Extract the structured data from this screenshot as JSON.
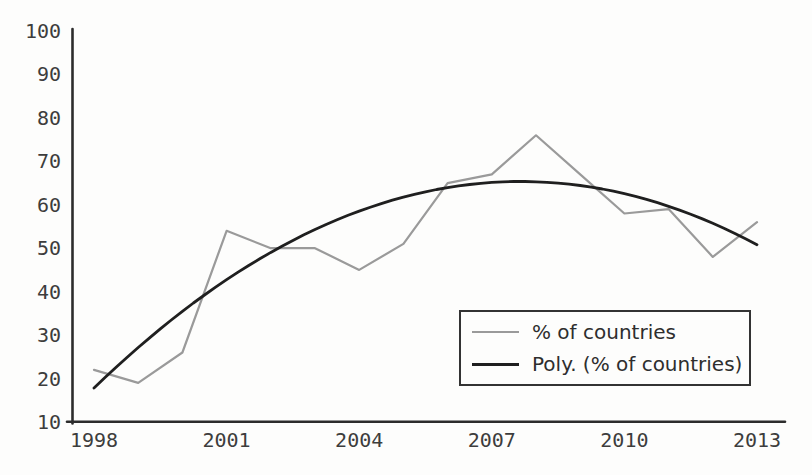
{
  "chart_data": {
    "type": "line",
    "x": [
      1998,
      1999,
      2000,
      2001,
      2002,
      2003,
      2004,
      2005,
      2006,
      2007,
      2008,
      2009,
      2010,
      2011,
      2012,
      2013
    ],
    "x_tick_labels": [
      "1998",
      "2001",
      "2004",
      "2007",
      "2010",
      "2013"
    ],
    "y_ticks": [
      10,
      20,
      30,
      40,
      50,
      60,
      70,
      80,
      90,
      100
    ],
    "xlim": [
      1998,
      2013
    ],
    "ylim": [
      10,
      100
    ],
    "grid": false,
    "legend_position": "lower-right",
    "xlabel": "",
    "ylabel": "",
    "series": [
      {
        "name": "% of countries",
        "kind": "data",
        "color": "#9a9a9a",
        "values": [
          22,
          19,
          26,
          54,
          50,
          50,
          45,
          51,
          65,
          67,
          76,
          67,
          58,
          59,
          48,
          56
        ]
      },
      {
        "name": "Poly. (% of countries)",
        "kind": "polynomial-trendline",
        "color": "#1f1f1f",
        "poly_coefficients": {
          "a": -0.51,
          "b": 9.85,
          "c": 17.8,
          "t": "year-1998"
        },
        "values": [
          17.8,
          27.1,
          35.5,
          42.8,
          49.0,
          54.3,
          58.5,
          61.8,
          64.0,
          65.1,
          65.3,
          64.4,
          62.6,
          59.7,
          55.7,
          50.8
        ]
      }
    ]
  },
  "colors": {
    "axis": "#2c2c2c",
    "tick_text": "#3d3d3d",
    "background": "#fdfdfc",
    "legend_border": "#333333"
  }
}
